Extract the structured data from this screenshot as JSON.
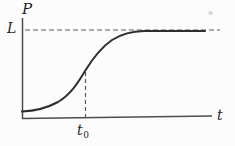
{
  "figure": {
    "y_axis_label": "P",
    "x_axis_label": "t",
    "asymptote_label": "L",
    "inflection_label_base": "t",
    "inflection_label_sub": "0"
  },
  "chart_data": {
    "type": "line",
    "xlabel": "t",
    "ylabel": "P",
    "grid": false,
    "legend": false,
    "series": [
      {
        "name": "P(t)",
        "description": "S-shaped logistic curve starting just above the t-axis, steepest at t = t0 (where P is about L/2), then leveling off at the carrying capacity L",
        "normalized_points": [
          {
            "t": 0.0,
            "P_over_L": 0.08
          },
          {
            "t": 0.2,
            "P_over_L": 0.12
          },
          {
            "t": 0.33,
            "P_over_L": 0.5
          },
          {
            "t": 0.5,
            "P_over_L": 0.9
          },
          {
            "t": 0.65,
            "P_over_L": 0.99
          },
          {
            "t": 1.0,
            "P_over_L": 1.0
          }
        ]
      }
    ],
    "annotations": [
      {
        "label": "L",
        "kind": "dashed horizontal asymptote at P = L"
      },
      {
        "label": "t0",
        "kind": "dashed vertical guide from inflection point down to the t-axis"
      }
    ],
    "axis_ranges": {
      "x": "unlabeled, origin to beyond t0",
      "y": "unlabeled, 0 to L"
    },
    "geometry_px": {
      "y_axis": {
        "x": 22.5,
        "y1": 18,
        "y2": 119
      },
      "x_axis": {
        "x1": 22,
        "y1": 118.5,
        "x2": 212,
        "y2": 116
      },
      "asymptote": {
        "y": 30,
        "x1": 25,
        "x2": 220,
        "dash": "5,3"
      },
      "inflection_guide": {
        "x": 85.5,
        "y1": 72,
        "y2": 120.5,
        "dash": "4,3"
      },
      "curve_path": "M 22 111.5 C 34 111, 46 108.5, 58 102 C 70 95, 77 84.5, 85 71 C 93 58, 101 47.5, 112 40 C 122 33.8, 132 31.2, 144 31 L 205 31"
    }
  },
  "colors": {
    "background": "#fcfcfc",
    "curve": "#2f2f2f",
    "axis": "#4d4d4d",
    "dashed": "#5a5a5a",
    "text": "#1f1f1f"
  }
}
